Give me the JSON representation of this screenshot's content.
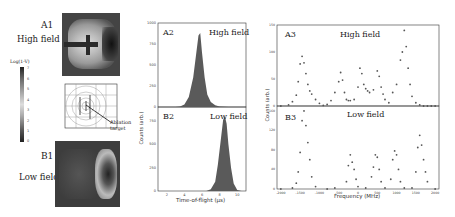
{
  "panelA1": {
    "label": "A1",
    "subtitle": "High field"
  },
  "panelB1": {
    "label": "B1",
    "subtitle": "Low field"
  },
  "colorbar": {
    "label": "Log(1-V)",
    "ticks": [
      "7",
      "6",
      "5",
      "4",
      "3",
      "2",
      "1",
      "0"
    ]
  },
  "geometry": {
    "annotation": "Ablation target"
  },
  "chart_data": [
    {
      "id": "A2",
      "type": "area",
      "title": "High field",
      "xlabel": "Time-of-flight (μs)",
      "ylabel": "Counts (arb.)",
      "xlim": [
        1,
        11
      ],
      "ylim": [
        0,
        1000
      ],
      "xticks": [
        2,
        4,
        6,
        8,
        10
      ],
      "yticks": [
        0,
        250,
        500,
        750,
        1000
      ],
      "x": [
        3,
        3.5,
        4,
        4.5,
        5,
        5.3,
        5.6,
        5.8,
        6,
        6.3,
        6.6,
        7,
        7.5,
        8,
        9
      ],
      "values": [
        0,
        5,
        30,
        120,
        350,
        600,
        850,
        880,
        650,
        350,
        150,
        60,
        20,
        5,
        0
      ]
    },
    {
      "id": "B2",
      "type": "area",
      "title": "Low field",
      "xlabel": "Time-of-flight (μs)",
      "ylabel": "Counts (arb.)",
      "xlim": [
        1,
        11
      ],
      "ylim": [
        0,
        900
      ],
      "xticks": [
        2,
        4,
        6,
        8,
        10
      ],
      "yticks": [
        0,
        250,
        500,
        750
      ],
      "x": [
        6.5,
        7,
        7.5,
        7.8,
        8.1,
        8.4,
        8.6,
        8.8,
        9,
        9.3,
        9.6,
        10,
        10.5
      ],
      "values": [
        0,
        20,
        100,
        280,
        520,
        760,
        800,
        720,
        500,
        250,
        80,
        10,
        0
      ]
    },
    {
      "id": "A3",
      "type": "scatter",
      "title": "High field",
      "xlabel": "Frequency (MHz)",
      "ylabel": "Counts (arb.)",
      "xlim": [
        -2100,
        2100
      ],
      "ylim": [
        0,
        150
      ],
      "xticks": [
        -2000,
        -1500,
        -1000,
        -500,
        0,
        500,
        1000,
        1500,
        2000
      ],
      "yticks": [
        0,
        50,
        100,
        150
      ],
      "x": [
        -2000,
        -1800,
        -1700,
        -1600,
        -1550,
        -1500,
        -1450,
        -1400,
        -1350,
        -1300,
        -1250,
        -1200,
        -1100,
        -1000,
        -900,
        -800,
        -700,
        -600,
        -500,
        -450,
        -400,
        -350,
        -300,
        -250,
        -200,
        -100,
        0,
        50,
        100,
        150,
        200,
        250,
        300,
        400,
        500,
        550,
        600,
        650,
        700,
        800,
        900,
        1000,
        1100,
        1150,
        1200,
        1250,
        1300,
        1350,
        1400,
        1500,
        1600,
        1700,
        1800,
        1900,
        2000
      ],
      "values": [
        0,
        2,
        8,
        20,
        45,
        78,
        92,
        80,
        60,
        40,
        28,
        22,
        12,
        5,
        1,
        3,
        10,
        25,
        45,
        62,
        48,
        25,
        12,
        10,
        10,
        12,
        35,
        70,
        60,
        40,
        32,
        28,
        25,
        30,
        65,
        55,
        35,
        22,
        12,
        6,
        25,
        40,
        85,
        100,
        140,
        110,
        70,
        40,
        18,
        6,
        2,
        0,
        0,
        0,
        0
      ]
    },
    {
      "id": "B3",
      "type": "scatter",
      "title": "Low field",
      "xlabel": "Frequency (MHz)",
      "ylabel": "Counts (arb.)",
      "xlim": [
        -2100,
        2100
      ],
      "ylim": [
        0,
        170
      ],
      "xticks": [
        -2000,
        -1500,
        -1000,
        -500,
        0,
        500,
        1000,
        1500,
        2000
      ],
      "yticks": [
        0,
        40,
        80,
        120,
        160
      ],
      "x": [
        -2000,
        -1700,
        -1600,
        -1550,
        -1500,
        -1450,
        -1400,
        -1350,
        -1300,
        -1250,
        -1200,
        -1100,
        -800,
        -600,
        -300,
        -250,
        -200,
        -150,
        -100,
        -50,
        0,
        200,
        350,
        400,
        450,
        500,
        550,
        600,
        700,
        850,
        900,
        950,
        1000,
        1050,
        1100,
        1200,
        1400,
        1500,
        1550,
        1600,
        1650,
        1700,
        1750,
        1800,
        2000
      ],
      "values": [
        0,
        2,
        12,
        35,
        75,
        140,
        160,
        130,
        95,
        60,
        25,
        5,
        0,
        2,
        15,
        48,
        70,
        55,
        40,
        20,
        5,
        2,
        25,
        45,
        70,
        65,
        40,
        15,
        2,
        20,
        60,
        78,
        70,
        40,
        15,
        2,
        2,
        35,
        85,
        110,
        90,
        60,
        35,
        15,
        0
      ]
    }
  ]
}
